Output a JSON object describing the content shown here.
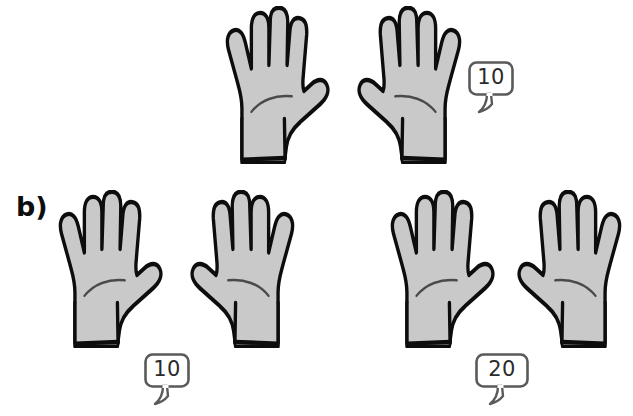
{
  "figure": {
    "background_color": "#ffffff",
    "hand_fill_color": "#c9c9c9",
    "hand_outline_color": "#0d0d0d",
    "bubble_outline_color": "#5a5a5a",
    "bubble_text_color": "#2b2b2b",
    "label_color": "#0d0d0d"
  },
  "part_label": {
    "text": "b)"
  },
  "rows": [
    {
      "id": "row-top",
      "hands": [
        {
          "id": "hand-top-1",
          "orientation": "thumb-right",
          "fingers": 5,
          "alt": "open hand showing five fingers"
        },
        {
          "id": "hand-top-2",
          "orientation": "thumb-left",
          "fingers": 5,
          "alt": "open hand showing five fingers"
        }
      ],
      "bubble": {
        "id": "bubble-top",
        "value": "10"
      }
    },
    {
      "id": "row-bottom-left",
      "hands": [
        {
          "id": "hand-bl-1",
          "orientation": "thumb-right",
          "fingers": 5,
          "alt": "open hand showing five fingers"
        },
        {
          "id": "hand-bl-2",
          "orientation": "thumb-left",
          "fingers": 5,
          "alt": "open hand showing five fingers"
        }
      ],
      "bubble": {
        "id": "bubble-bottom-left",
        "value": "10"
      }
    },
    {
      "id": "row-bottom-right",
      "hands": [
        {
          "id": "hand-br-1",
          "orientation": "thumb-right",
          "fingers": 5,
          "alt": "open hand showing five fingers"
        },
        {
          "id": "hand-br-2",
          "orientation": "thumb-left",
          "fingers": 5,
          "alt": "open hand showing five fingers"
        }
      ],
      "bubble": {
        "id": "bubble-bottom-right",
        "value": "20"
      }
    }
  ],
  "bubbles": {
    "top": "10",
    "bottom_left": "10",
    "bottom_right": "20"
  }
}
